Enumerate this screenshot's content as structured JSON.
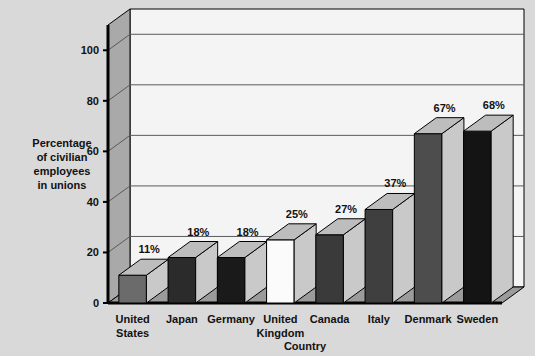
{
  "chart_data": {
    "type": "bar",
    "title": "",
    "xlabel": "Country",
    "ylabel": "Percentage of civilian employees in unions",
    "ylabel_lines": [
      "Percentage",
      "of civilian",
      "employees",
      "in unions"
    ],
    "categories": [
      "United States",
      "Japan",
      "Germany",
      "United Kingdom",
      "Canada",
      "Italy",
      "Denmark",
      "Sweden"
    ],
    "category_lines": [
      [
        "United",
        "States"
      ],
      [
        "Japan"
      ],
      [
        "Germany"
      ],
      [
        "United",
        "Kingdom"
      ],
      [
        "Canada"
      ],
      [
        "Italy"
      ],
      [
        "Denmark"
      ],
      [
        "Sweden"
      ]
    ],
    "values": [
      11,
      18,
      18,
      25,
      27,
      37,
      67,
      68
    ],
    "value_labels": [
      "11%",
      "18%",
      "18%",
      "25%",
      "27%",
      "37%",
      "67%",
      "68%"
    ],
    "ylim": [
      0,
      110
    ],
    "yticks": [
      0,
      20,
      40,
      60,
      80,
      100
    ],
    "ytick_labels": [
      "0",
      "20",
      "40",
      "60",
      "80",
      "100"
    ],
    "grid": true,
    "legend": "none",
    "bar_colors": [
      "#6b6b6b",
      "#2b2b2b",
      "#1a1a1a",
      "#fbfbfb",
      "#3a3a3a",
      "#3f3f3f",
      "#4d4d4d",
      "#141414"
    ],
    "style": {
      "page_background": "#d9d9d9",
      "back_wall": "#f4f4f4",
      "side_wall": "#a9a9a9",
      "floor": "#9b9b9b",
      "outline": "#000000",
      "grid_color": "#5a5a5a",
      "text_color": "#111111"
    }
  }
}
